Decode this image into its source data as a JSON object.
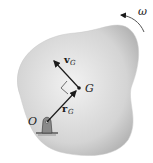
{
  "diagram": {
    "labels": {
      "omega": "ω",
      "origin": "O",
      "center_of_mass": "G",
      "velocity_vector": "v",
      "velocity_subscript": "G",
      "position_vector": "r",
      "position_subscript": "G"
    },
    "colors": {
      "body_fill_light": "#ececec",
      "body_fill_dark": "#b4b4b4",
      "stroke": "#1a1a1a",
      "pin": "#8a8a8a"
    }
  }
}
